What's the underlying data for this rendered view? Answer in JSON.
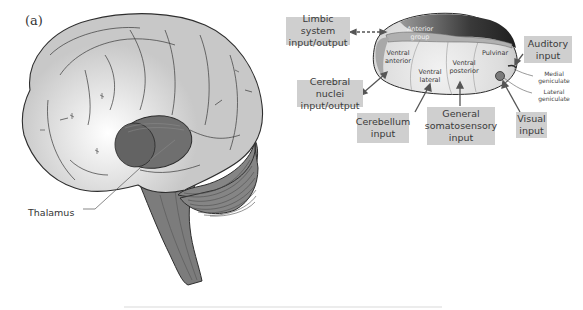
{
  "figure": {
    "panel_label": "(a)",
    "brain": {
      "thalamus_label": "Thalamus"
    },
    "thalamus_detail": {
      "regions": {
        "anterior_group": [
          "Anterior",
          "group"
        ],
        "ventral_anterior": [
          "Ventral",
          "anterior"
        ],
        "ventral_lateral": [
          "Ventral",
          "lateral"
        ],
        "ventral_posterior": [
          "Ventral",
          "posterior"
        ],
        "pulvinar": "Pulvinar",
        "medial_geniculate": [
          "Medial",
          "geniculate"
        ],
        "lateral_geniculate": [
          "Lateral",
          "geniculate"
        ]
      },
      "connection_labels": {
        "limbic": [
          "Limbic system",
          "input/output"
        ],
        "cerebral_nuclei": [
          "Cerebral nuclei",
          "input/output"
        ],
        "cerebellum": [
          "Cerebellum",
          "input"
        ],
        "somatosensory": [
          "General",
          "somatosensory",
          "input"
        ],
        "visual": [
          "Visual",
          "input"
        ],
        "auditory": [
          "Auditory",
          "input"
        ]
      }
    },
    "colors": {
      "brain_fill": "#c9c9c9",
      "brain_highlight": "#f4f4f4",
      "thalamus_dark": "#6f6f6f",
      "brainstem": "#7c7c7c",
      "cerebellum": "#858585",
      "label_box": "#cfcfcf",
      "outline": "#2e2e2e"
    }
  }
}
